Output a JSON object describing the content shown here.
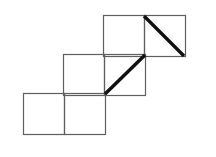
{
  "figure": {
    "type": "line-drawing",
    "canvas": {
      "width": 216,
      "height": 157,
      "background": "#ffffff"
    },
    "style": {
      "square_stroke_color": "#5f5f5f",
      "square_stroke_width": 1.2,
      "diagonal_stroke_color": "#111111",
      "diagonal_stroke_width": 3.4,
      "fill": "none"
    },
    "grid": {
      "cell_size": 41,
      "rows": 3,
      "columns_per_row": 2,
      "row_step_x": -40,
      "row_step_y": 39
    },
    "squares": [
      {
        "id": "top-left",
        "row": 1,
        "col": 1,
        "x": 103,
        "y": 15,
        "size": 41,
        "has_diagonal": false,
        "diagonal_direction": "none"
      },
      {
        "id": "top-right",
        "row": 1,
        "col": 2,
        "x": 144,
        "y": 15,
        "size": 41,
        "has_diagonal": true,
        "diagonal_direction": "top-left-to-bottom-right"
      },
      {
        "id": "middle-left",
        "row": 2,
        "col": 1,
        "x": 63,
        "y": 54,
        "size": 41,
        "has_diagonal": false,
        "diagonal_direction": "none"
      },
      {
        "id": "middle-right",
        "row": 2,
        "col": 2,
        "x": 104,
        "y": 54,
        "size": 41,
        "has_diagonal": true,
        "diagonal_direction": "bottom-left-to-top-right"
      },
      {
        "id": "bottom-left",
        "row": 3,
        "col": 1,
        "x": 23,
        "y": 93,
        "size": 41,
        "has_diagonal": false,
        "diagonal_direction": "none"
      },
      {
        "id": "bottom-right",
        "row": 3,
        "col": 2,
        "x": 64,
        "y": 93,
        "size": 41,
        "has_diagonal": false,
        "diagonal_direction": "none"
      }
    ],
    "diagonals": [
      {
        "id": "upper-diagonal",
        "square": "top-right",
        "x1": 144,
        "y1": 16,
        "x2": 184,
        "y2": 56,
        "direction": "descending"
      },
      {
        "id": "middle-diagonal",
        "square": "middle-right",
        "x1": 105,
        "y1": 94,
        "x2": 145,
        "y2": 55,
        "direction": "ascending"
      }
    ]
  }
}
